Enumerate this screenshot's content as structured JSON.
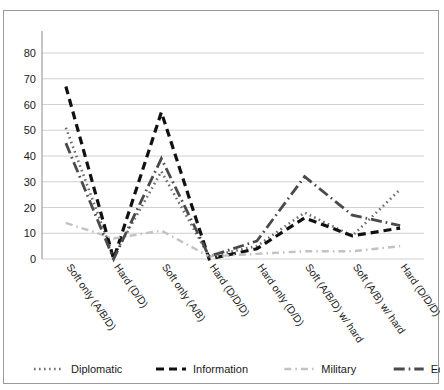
{
  "chart_data": {
    "type": "line",
    "title": "",
    "subtitle": "",
    "xlabel": "",
    "ylabel": "",
    "ylim": [
      0,
      80
    ],
    "ytick_values": [
      0,
      10,
      20,
      30,
      40,
      50,
      60,
      70,
      80
    ],
    "ytick_labels": [
      "0",
      "10",
      "20",
      "30",
      "40",
      "50",
      "60",
      "70",
      "80"
    ],
    "grid": true,
    "legend_position": "bottom",
    "categories": [
      "Soft only (A/B/D)",
      "Hard (D/D)",
      "Soft only (A/B)",
      "Hard (D/D/D)",
      "Hard only (D/D)",
      "Soft (A/B/D)",
      "Soft (A/B) w/ hard",
      "Hard (D/D/D)"
    ],
    "x_labels_full": [
      "Soft only (A/B/D)",
      "Hard (D/D)",
      "Soft only (A/B)",
      "Hard (D/D/D)",
      "Hard only (D/D)",
      "Soft (A/B/D) w/ hard",
      "Soft (A/B) w/ hard",
      "Hard (D/D/D)"
    ],
    "series": [
      {
        "name": "Diplomatic",
        "style": "dotted",
        "color": "#6e6e6e",
        "values": [
          51,
          1,
          34,
          1,
          5,
          18,
          9,
          27
        ]
      },
      {
        "name": "Information",
        "style": "dashed",
        "color": "#111111",
        "values": [
          67,
          0,
          57,
          0,
          4,
          16,
          9,
          12
        ]
      },
      {
        "name": "Military",
        "style": "dash-dot-light",
        "color": "#c2c2c2",
        "values": [
          14,
          8,
          11,
          1,
          2,
          3,
          3,
          5
        ]
      },
      {
        "name": "Economic",
        "style": "long-dash-dot",
        "color": "#4a4a4a",
        "values": [
          45,
          0,
          39,
          1,
          7,
          32,
          17,
          13
        ]
      }
    ]
  },
  "legend": {
    "items": [
      {
        "label": "Diplomatic"
      },
      {
        "label": "Information"
      },
      {
        "label": "Military"
      },
      {
        "label": "Economic"
      }
    ]
  },
  "axes": {
    "y_axis_name": "value-axis",
    "x_axis_name": "category-axis"
  }
}
